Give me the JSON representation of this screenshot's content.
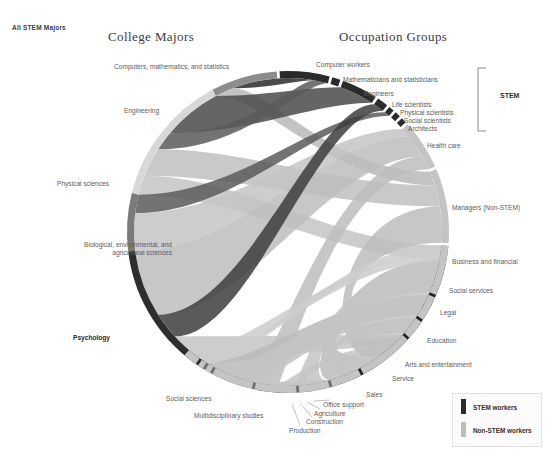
{
  "corner_tag": "All STEM Majors",
  "titles": {
    "left": "College Majors",
    "right": "Occupation Groups"
  },
  "bracket_label": "STEM",
  "legend": {
    "items": [
      {
        "label": "STEM workers",
        "color": "#2b2b2b"
      },
      {
        "label": "Non-STEM workers",
        "color": "#bdbdbd"
      }
    ]
  },
  "chart_data": {
    "type": "chord",
    "title": "All STEM Majors",
    "highlighted": "Psychology",
    "left_axis_title": "College Majors",
    "right_axis_title": "Occupation Groups",
    "center": [
      288,
      232
    ],
    "radius": 161,
    "majors": [
      {
        "label": "Computers, mathematics, and statistics",
        "value": 8,
        "color": "#8c8c8c",
        "a0": -86,
        "a1": -62
      },
      {
        "label": "Engineering",
        "value": 16,
        "color": "#d8d8d8",
        "a0": -62,
        "a1": -14
      },
      {
        "label": "Physical sciences",
        "value": 7,
        "color": "#7b7b7b",
        "a0": -14,
        "a1": 7
      },
      {
        "label": "Biological, environmental, and agricultural  sciences",
        "value": 17,
        "color": "#2e2e2e",
        "a0": 7,
        "a1": 58
      },
      {
        "label": "Psychology",
        "value": 16,
        "color": "#6e6e6e",
        "a0": 58,
        "a1": 106
      },
      {
        "label": "Social sciences",
        "value": 21,
        "color": "#232323",
        "a0": 106,
        "a1": 169
      },
      {
        "label": "Multidisciplinary studies",
        "value": 2,
        "color": "#575757",
        "a0": 169,
        "a1": 175
      }
    ],
    "occupations": [
      {
        "label": "Computer workers",
        "value": 9,
        "color": "#2b2b2b",
        "group": "STEM",
        "a0": -93,
        "a1": -75
      },
      {
        "label": "Mathematicians and statisticians",
        "value": 1,
        "color": "#2b2b2b",
        "group": "STEM",
        "a0": -74,
        "a1": -71
      },
      {
        "label": "Engineers",
        "value": 6,
        "color": "#2b2b2b",
        "group": "STEM",
        "a0": -70,
        "a1": -57
      },
      {
        "label": "Life scientists",
        "value": 2,
        "color": "#2b2b2b",
        "group": "STEM",
        "a0": -56,
        "a1": -52
      },
      {
        "label": "Physical scientists",
        "value": 1,
        "color": "#2b2b2b",
        "group": "STEM",
        "a0": -51,
        "a1": -49
      },
      {
        "label": "Social scientists",
        "value": 1,
        "color": "#2b2b2b",
        "group": "STEM",
        "a0": -48,
        "a1": -46
      },
      {
        "label": "Architects",
        "value": 1,
        "color": "#2b2b2b",
        "group": "STEM",
        "a0": -45,
        "a1": -43
      },
      {
        "label": "Health care",
        "value": 8,
        "color": "#c4c4c4",
        "group": "Non-STEM",
        "a0": -42,
        "a1": -24
      },
      {
        "label": "Managers (Non-STEM)",
        "value": 12,
        "color": "#c4c4c4",
        "group": "Non-STEM",
        "a0": -23,
        "a1": 4
      },
      {
        "label": "Business and financial",
        "value": 8,
        "color": "#c4c4c4",
        "group": "Non-STEM",
        "a0": 5,
        "a1": 23
      },
      {
        "label": "Social services",
        "value": 4,
        "color": "#c4c4c4",
        "group": "Non-STEM",
        "a0": 24,
        "a1": 33
      },
      {
        "label": "Legal",
        "value": 3,
        "color": "#c4c4c4",
        "group": "Non-STEM",
        "a0": 34,
        "a1": 41
      },
      {
        "label": "Education",
        "value": 9,
        "color": "#c4c4c4",
        "group": "Non-STEM",
        "a0": 42,
        "a1": 62
      },
      {
        "label": "Arts and entertainment",
        "value": 5,
        "color": "#c4c4c4",
        "group": "Non-STEM",
        "a0": 63,
        "a1": 74
      },
      {
        "label": "Service",
        "value": 5,
        "color": "#c4c4c4",
        "group": "Non-STEM",
        "a0": 75,
        "a1": 86
      },
      {
        "label": "Sales",
        "value": 7,
        "color": "#c4c4c4",
        "group": "Non-STEM",
        "a0": 87,
        "a1": 102
      },
      {
        "label": "Office support",
        "value": 7,
        "color": "#c4c4c4",
        "group": "Non-STEM",
        "a0": 103,
        "a1": 118
      },
      {
        "label": "Agriculture",
        "value": 1,
        "color": "#c4c4c4",
        "group": "Non-STEM",
        "a0": 119,
        "a1": 121
      },
      {
        "label": "Construction",
        "value": 1,
        "color": "#c4c4c4",
        "group": "Non-STEM",
        "a0": 122,
        "a1": 124
      },
      {
        "label": "Production",
        "value": 2,
        "color": "#c4c4c4",
        "group": "Non-STEM",
        "a0": 125,
        "a1": 130
      }
    ],
    "ribbons": [
      {
        "source": "Computers, mathematics, and statistics",
        "target": "Computer workers",
        "value": 5,
        "color": "#2b2b2b"
      },
      {
        "source": "Computers, mathematics, and statistics",
        "target": "Managers (Non-STEM)",
        "value": 2,
        "color": "#b8b8b8"
      },
      {
        "source": "Engineering",
        "target": "Engineers",
        "value": 6,
        "color": "#4a4a4a"
      },
      {
        "source": "Engineering",
        "target": "Computer workers",
        "value": 2,
        "color": "#5a5a5a"
      },
      {
        "source": "Engineering",
        "target": "Managers (Non-STEM)",
        "value": 3,
        "color": "#c0c0c0"
      },
      {
        "source": "Engineering",
        "target": "Business and financial",
        "value": 2,
        "color": "#c4c4c4"
      },
      {
        "source": "Physical sciences",
        "target": "Physical scientists",
        "value": 1,
        "color": "#5a5a5a"
      },
      {
        "source": "Physical sciences",
        "target": "Health care",
        "value": 2,
        "color": "#c4c4c4"
      },
      {
        "source": "Biological, environmental, and agricultural  sciences",
        "target": "Health care",
        "value": 5,
        "color": "#bdbdbd"
      },
      {
        "source": "Biological, environmental, and agricultural  sciences",
        "target": "Life scientists",
        "value": 2,
        "color": "#3d3d3d"
      },
      {
        "source": "Biological, environmental, and agricultural  sciences",
        "target": "Education",
        "value": 3,
        "color": "#c4c4c4"
      },
      {
        "source": "Psychology",
        "target": "Social services",
        "value": 4,
        "color": "#bababa"
      },
      {
        "source": "Psychology",
        "target": "Health care",
        "value": 3,
        "color": "#bdbdbd"
      },
      {
        "source": "Psychology",
        "target": "Education",
        "value": 3,
        "color": "#c4c4c4"
      },
      {
        "source": "Psychology",
        "target": "Sales",
        "value": 2,
        "color": "#c4c4c4"
      },
      {
        "source": "Social sciences",
        "target": "Business and financial",
        "value": 5,
        "color": "#bdbdbd"
      },
      {
        "source": "Social sciences",
        "target": "Legal",
        "value": 3,
        "color": "#c0c0c0"
      },
      {
        "source": "Social sciences",
        "target": "Managers (Non-STEM)",
        "value": 5,
        "color": "#bdbdbd"
      },
      {
        "source": "Social sciences",
        "target": "Education",
        "value": 4,
        "color": "#c4c4c4"
      },
      {
        "source": "Social sciences",
        "target": "Office support",
        "value": 4,
        "color": "#c4c4c4"
      },
      {
        "source": "Social sciences",
        "target": "Arts and entertainment",
        "value": 3,
        "color": "#c4c4c4"
      },
      {
        "source": "Social sciences",
        "target": "Service",
        "value": 3,
        "color": "#c4c4c4"
      },
      {
        "source": "Multidisciplinary studies",
        "target": "Production",
        "value": 1,
        "color": "#cccccc"
      },
      {
        "source": "Multidisciplinary studies",
        "target": "Construction",
        "value": 1,
        "color": "#cccccc"
      }
    ]
  },
  "labels": {
    "majors": [
      {
        "key": "computers",
        "x": 114,
        "y": 63,
        "align": "left"
      },
      {
        "key": "engineering",
        "x": 124,
        "y": 107,
        "align": "left"
      },
      {
        "key": "physical",
        "x": 57,
        "y": 180,
        "align": "left"
      },
      {
        "key": "biological",
        "x": 80,
        "y": 241,
        "align": "left"
      },
      {
        "key": "psychology",
        "x": 73,
        "y": 334,
        "align": "left"
      },
      {
        "key": "social",
        "x": 166,
        "y": 395,
        "align": "left"
      },
      {
        "key": "multidisc",
        "x": 194,
        "y": 412,
        "align": "left"
      }
    ],
    "occupations": [
      {
        "key": "computer-workers",
        "x": 316,
        "y": 61
      },
      {
        "key": "mathematicians",
        "x": 343,
        "y": 76
      },
      {
        "key": "engineers",
        "x": 364,
        "y": 90
      },
      {
        "key": "life-scientists",
        "x": 392,
        "y": 101
      },
      {
        "key": "physical-sci",
        "x": 400,
        "y": 109
      },
      {
        "key": "social-sci",
        "x": 404,
        "y": 117
      },
      {
        "key": "architects",
        "x": 408,
        "y": 125
      },
      {
        "key": "health-care",
        "x": 427,
        "y": 142
      },
      {
        "key": "managers",
        "x": 452,
        "y": 204
      },
      {
        "key": "business",
        "x": 452,
        "y": 258
      },
      {
        "key": "social-services",
        "x": 449,
        "y": 287
      },
      {
        "key": "legal",
        "x": 440,
        "y": 309
      },
      {
        "key": "education",
        "x": 427,
        "y": 337
      },
      {
        "key": "arts",
        "x": 405,
        "y": 361
      },
      {
        "key": "service",
        "x": 392,
        "y": 375
      },
      {
        "key": "sales",
        "x": 366,
        "y": 391
      },
      {
        "key": "office-support",
        "x": 323,
        "y": 401
      },
      {
        "key": "agriculture",
        "x": 314,
        "y": 410
      },
      {
        "key": "construction",
        "x": 306,
        "y": 418
      },
      {
        "key": "production",
        "x": 289,
        "y": 427
      }
    ]
  }
}
